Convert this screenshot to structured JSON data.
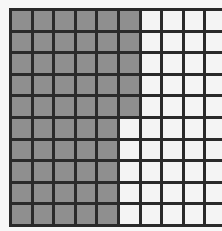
{
  "grid": {
    "rows": 10,
    "cols": 10,
    "shaded_color": "#8f8f8f",
    "unshaded_color": "#f4f4f4",
    "line_color": "#2a2a2a",
    "shaded_cols_per_row": [
      6,
      6,
      6,
      6,
      6,
      5,
      5,
      5,
      5,
      5
    ],
    "shaded_count": 55,
    "total_cells": 100
  }
}
